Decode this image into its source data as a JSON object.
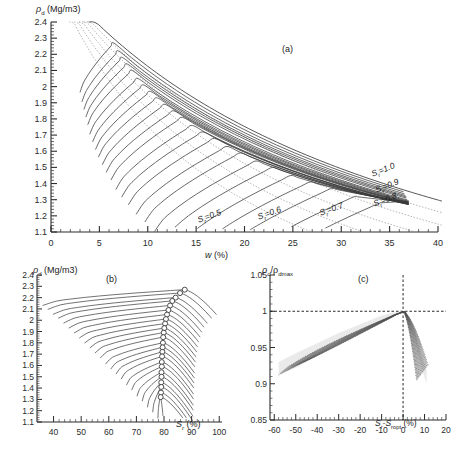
{
  "figure": {
    "type": "multi-panel-scientific-figure",
    "panel_count": 3,
    "line_color": "#3a3a3a",
    "dotted_color": "#8a8a8a",
    "axis_color": "#2b2b2b"
  },
  "panel_a": {
    "tag": "(a)",
    "ylabel_rho": "ρ",
    "ylabel_sub": "d",
    "ylabel_unit": " (Mg/m3)",
    "xlabel_main": "w",
    "xlabel_unit": " (%)",
    "y_ticks": [
      "1.1",
      "1.2",
      "1.3",
      "1.4",
      "1.5",
      "1.6",
      "1.7",
      "1.8",
      "1.9",
      "2",
      "2.1",
      "2.2",
      "2.3",
      "2.4"
    ],
    "y_values": [
      1.1,
      1.2,
      1.3,
      1.4,
      1.5,
      1.6,
      1.7,
      1.8,
      1.9,
      2.0,
      2.1,
      2.2,
      2.3,
      2.4
    ],
    "x_ticks": [
      "0",
      "5",
      "10",
      "15",
      "20",
      "25",
      "30",
      "35",
      "40"
    ],
    "x_values": [
      0,
      5,
      10,
      15,
      20,
      25,
      30,
      35,
      40
    ],
    "ylim": [
      1.1,
      2.4
    ],
    "xlim": [
      0,
      40
    ],
    "minor_per_major_x": 5,
    "minor_per_major_y": 5,
    "saturation_labels": [
      {
        "text": "S",
        "sub": "r",
        "value": "=1.0"
      },
      {
        "text": "S",
        "sub": "r",
        "value": "=0.9"
      },
      {
        "text": "S",
        "sub": "r",
        "value": "=0.8"
      },
      {
        "text": "S",
        "sub": "r",
        "value": "=0.7"
      },
      {
        "text": "S",
        "sub": "r",
        "value": "=0.6"
      },
      {
        "text": "S",
        "sub": "r",
        "value": "=0.5"
      }
    ]
  },
  "panel_b": {
    "tag": "(b)",
    "ylabel_rho": "ρ",
    "ylabel_sub": "d",
    "ylabel_unit": " (Mg/m3)",
    "xlabel_main": "S",
    "xlabel_sub": "r",
    "xlabel_unit": " (%)",
    "y_ticks": [
      "1.1",
      "1.2",
      "1.3",
      "1.4",
      "1.5",
      "1.6",
      "1.7",
      "1.8",
      "1.9",
      "2",
      "2.1",
      "2.2",
      "2.3",
      "2.4"
    ],
    "y_values": [
      1.1,
      1.2,
      1.3,
      1.4,
      1.5,
      1.6,
      1.7,
      1.8,
      1.9,
      2.0,
      2.1,
      2.2,
      2.3,
      2.4
    ],
    "x_ticks": [
      "40",
      "50",
      "60",
      "70",
      "80",
      "90",
      "100"
    ],
    "x_values": [
      40,
      50,
      60,
      70,
      80,
      90,
      100
    ],
    "ylim": [
      1.1,
      2.4
    ],
    "xlim": [
      34,
      101
    ],
    "marker": "open-circle"
  },
  "panel_c": {
    "tag": "(c)",
    "ylabel_main": "ρ",
    "ylabel_sub1": "d",
    "ylabel_slash": "/ρ",
    "ylabel_sub2": "dmax",
    "xlabel_main": "S",
    "xlabel_sub1": "r",
    "xlabel_dash": "-S",
    "xlabel_sub2": "ropt",
    "xlabel_unit": " (%)",
    "y_ticks": [
      "0.85",
      "0.9",
      "0.95",
      "1",
      "1.05"
    ],
    "y_values": [
      0.85,
      0.9,
      0.95,
      1.0,
      1.05
    ],
    "x_ticks": [
      "-60",
      "-50",
      "-40",
      "-30",
      "-20",
      "-10",
      "0",
      "10",
      "20"
    ],
    "x_values": [
      -60,
      -50,
      -40,
      -30,
      -20,
      -10,
      0,
      10,
      20
    ],
    "ylim": [
      0.85,
      1.05
    ],
    "xlim": [
      -62,
      20
    ],
    "reference_lines": {
      "horizontal_at": 1.0,
      "vertical_at": 0
    }
  },
  "chart_data": [
    {
      "type": "line",
      "panel": "a",
      "title": "Compaction curves: dry density vs water content",
      "xlabel": "w (%)",
      "ylabel": "rho_d (Mg/m3)",
      "xlim": [
        0,
        40
      ],
      "ylim": [
        1.1,
        2.4
      ],
      "grid": false,
      "legend": [
        "Sr=1.0",
        "Sr=0.9",
        "Sr=0.8",
        "Sr=0.7",
        "Sr=0.6",
        "Sr=0.5"
      ],
      "legend_position": "inside-right",
      "description": "Family of 24 compaction curves (solid) each rising to an optimum then falling, overlaid on dotted constant-degree-of-saturation lines Sr=0.5 to 1.0 that fan down-right from the upper left.",
      "series": [
        {
          "name": "Gs_curve_1",
          "peak_w": 6.5,
          "peak_rho": 2.27,
          "start_w": 3.0,
          "end_w": 36.5
        },
        {
          "name": "Gs_curve_2",
          "peak_w": 7.0,
          "peak_rho": 2.22,
          "start_w": 3.2,
          "end_w": 36.6
        },
        {
          "name": "Gs_curve_3",
          "peak_w": 7.4,
          "peak_rho": 2.18,
          "start_w": 3.4,
          "end_w": 36.7
        },
        {
          "name": "Gs_curve_4",
          "peak_w": 7.9,
          "peak_rho": 2.14,
          "start_w": 3.6,
          "end_w": 36.8
        },
        {
          "name": "Gs_curve_5",
          "peak_w": 8.4,
          "peak_rho": 2.1,
          "start_w": 3.8,
          "end_w": 36.8
        },
        {
          "name": "Gs_curve_6",
          "peak_w": 9.0,
          "peak_rho": 2.05,
          "start_w": 4.0,
          "end_w": 36.9
        },
        {
          "name": "Gs_curve_7",
          "peak_w": 9.6,
          "peak_rho": 2.01,
          "start_w": 4.3,
          "end_w": 36.9
        },
        {
          "name": "Gs_curve_8",
          "peak_w": 10.3,
          "peak_rho": 1.97,
          "start_w": 4.6,
          "end_w": 37.0
        },
        {
          "name": "Gs_curve_9",
          "peak_w": 11.0,
          "peak_rho": 1.93,
          "start_w": 4.9,
          "end_w": 37.0
        },
        {
          "name": "Gs_curve_10",
          "peak_w": 11.8,
          "peak_rho": 1.89,
          "start_w": 5.3,
          "end_w": 37.0
        },
        {
          "name": "Gs_curve_11",
          "peak_w": 12.7,
          "peak_rho": 1.85,
          "start_w": 5.7,
          "end_w": 37.0
        },
        {
          "name": "Gs_curve_12",
          "peak_w": 13.6,
          "peak_rho": 1.81,
          "start_w": 6.2,
          "end_w": 37.0
        },
        {
          "name": "Gs_curve_13",
          "peak_w": 14.6,
          "peak_rho": 1.76,
          "start_w": 6.7,
          "end_w": 37.0
        },
        {
          "name": "Gs_curve_14",
          "peak_w": 15.7,
          "peak_rho": 1.72,
          "start_w": 7.3,
          "end_w": 37.0
        },
        {
          "name": "Gs_curve_15",
          "peak_w": 16.9,
          "peak_rho": 1.68,
          "start_w": 8.0,
          "end_w": 37.0
        },
        {
          "name": "Gs_curve_16",
          "peak_w": 18.2,
          "peak_rho": 1.63,
          "start_w": 8.8,
          "end_w": 37.0
        },
        {
          "name": "Gs_curve_17",
          "peak_w": 19.6,
          "peak_rho": 1.59,
          "start_w": 9.7,
          "end_w": 37.0
        },
        {
          "name": "Gs_curve_18",
          "peak_w": 21.2,
          "peak_rho": 1.54,
          "start_w": 10.7,
          "end_w": 37.0
        },
        {
          "name": "Gs_curve_19",
          "peak_w": 22.9,
          "peak_rho": 1.5,
          "start_w": 11.9,
          "end_w": 37.0
        },
        {
          "name": "Gs_curve_20",
          "peak_w": 24.8,
          "peak_rho": 1.45,
          "start_w": 13.2,
          "end_w": 37.0
        },
        {
          "name": "Gs_curve_21",
          "peak_w": 26.8,
          "peak_rho": 1.41,
          "start_w": 14.7,
          "end_w": 37.0
        },
        {
          "name": "Gs_curve_22",
          "peak_w": 29.0,
          "peak_rho": 1.37,
          "start_w": 16.4,
          "end_w": 37.0
        },
        {
          "name": "Gs_curve_23",
          "peak_w": 31.4,
          "peak_rho": 1.32,
          "start_w": 18.3,
          "end_w": 37.0
        },
        {
          "name": "Gs_curve_24",
          "peak_w": 34.0,
          "peak_rho": 1.28,
          "start_w": 20.5,
          "end_w": 37.0
        }
      ],
      "saturation_lines": [
        {
          "Sr": 1.0,
          "style": "solid-thin"
        },
        {
          "Sr": 0.9,
          "style": "dotted"
        },
        {
          "Sr": 0.8,
          "style": "dotted"
        },
        {
          "Sr": 0.7,
          "style": "dotted"
        },
        {
          "Sr": 0.6,
          "style": "dotted"
        },
        {
          "Sr": 0.5,
          "style": "dotted"
        }
      ]
    },
    {
      "type": "line",
      "panel": "b",
      "title": "Dry density vs degree of saturation",
      "xlabel": "Sr (%)",
      "ylabel": "rho_d (Mg/m3)",
      "xlim": [
        34,
        101
      ],
      "ylim": [
        1.1,
        2.4
      ],
      "grid": false,
      "description": "Same 24 curves replotted against degree of saturation; each rises gently from the left, peaks at an open-circle optimum marker near Sr 78-88%, then drops steeply.",
      "optima": [
        {
          "Sr_opt": 87.5,
          "rho_max": 2.27
        },
        {
          "Sr_opt": 85.8,
          "rho_max": 2.24
        },
        {
          "Sr_opt": 84.2,
          "rho_max": 2.2
        },
        {
          "Sr_opt": 83.0,
          "rho_max": 2.17
        },
        {
          "Sr_opt": 82.2,
          "rho_max": 2.13
        },
        {
          "Sr_opt": 81.6,
          "rho_max": 2.09
        },
        {
          "Sr_opt": 81.1,
          "rho_max": 2.05
        },
        {
          "Sr_opt": 80.7,
          "rho_max": 2.01
        },
        {
          "Sr_opt": 80.4,
          "rho_max": 1.97
        },
        {
          "Sr_opt": 80.1,
          "rho_max": 1.93
        },
        {
          "Sr_opt": 79.9,
          "rho_max": 1.89
        },
        {
          "Sr_opt": 79.7,
          "rho_max": 1.85
        },
        {
          "Sr_opt": 79.6,
          "rho_max": 1.8
        },
        {
          "Sr_opt": 79.5,
          "rho_max": 1.76
        },
        {
          "Sr_opt": 79.4,
          "rho_max": 1.72
        },
        {
          "Sr_opt": 79.3,
          "rho_max": 1.68
        },
        {
          "Sr_opt": 79.2,
          "rho_max": 1.63
        },
        {
          "Sr_opt": 79.2,
          "rho_max": 1.59
        },
        {
          "Sr_opt": 79.1,
          "rho_max": 1.54
        },
        {
          "Sr_opt": 79.1,
          "rho_max": 1.5
        },
        {
          "Sr_opt": 79.0,
          "rho_max": 1.45
        },
        {
          "Sr_opt": 79.0,
          "rho_max": 1.41
        },
        {
          "Sr_opt": 78.9,
          "rho_max": 1.36
        },
        {
          "Sr_opt": 78.8,
          "rho_max": 1.32
        }
      ]
    },
    {
      "type": "line",
      "panel": "c",
      "title": "Normalised dry density vs saturation offset",
      "xlabel": "Sr-Sropt (%)",
      "ylabel": "rho_d/rho_dmax",
      "xlim": [
        -62,
        20
      ],
      "ylim": [
        0.85,
        1.05
      ],
      "grid": false,
      "description": "All curves normalised collapse to a single narrow band peaking at (0, 1.0); a gentle rising limb from about (-58, 0.915) and a steep falling limb to about (11, 0.905). Dashed reference lines at y=1 and x=0.",
      "band": {
        "x": [
          -58,
          -50,
          -40,
          -30,
          -20,
          -10,
          -5,
          0,
          3,
          6,
          9,
          11
        ],
        "upper": [
          0.93,
          0.942,
          0.956,
          0.97,
          0.982,
          0.994,
          0.998,
          1.0,
          0.99,
          0.968,
          0.935,
          0.918
        ],
        "lower": [
          0.912,
          0.922,
          0.938,
          0.954,
          0.97,
          0.988,
          0.995,
          1.0,
          0.982,
          0.952,
          0.918,
          0.9
        ]
      }
    }
  ]
}
